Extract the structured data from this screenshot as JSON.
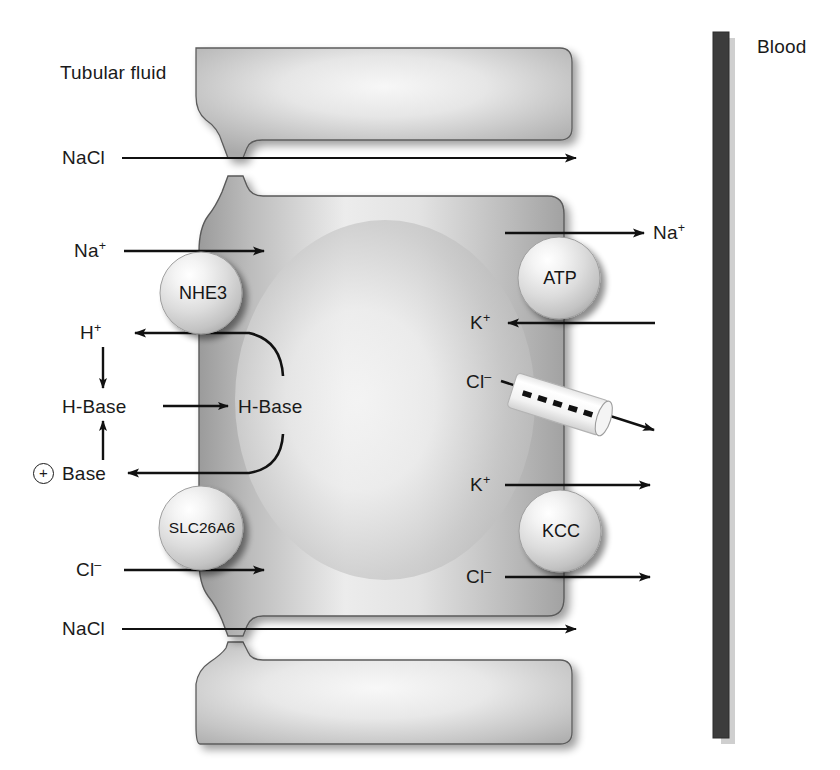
{
  "figure": {
    "type": "biological-cell-transport-diagram",
    "compartments": {
      "tubular_fluid_label": "Tubular fluid",
      "blood_label": "Blood"
    }
  },
  "labels": {
    "tubular_fluid": "Tubular fluid",
    "blood": "Blood",
    "nacl_top": "NaCl",
    "nacl_bottom": "NaCl",
    "na_apical": "Na",
    "na_apical_charge": "+",
    "h_apical": "H",
    "h_apical_charge": "+",
    "hbase_out": "H-Base",
    "hbase_in": "H-Base",
    "base_out": "Base",
    "base_plus_sign": "+",
    "cl_apical": "Cl",
    "cl_apical_charge": "–",
    "na_basolateral": "Na",
    "na_basolateral_charge": "+",
    "k_basolateral_in": "K",
    "k_basolateral_in_charge": "+",
    "cl_basolateral_channel": "Cl",
    "cl_basolateral_channel_charge": "–",
    "k_basolateral_kcc": "K",
    "k_basolateral_kcc_charge": "+",
    "cl_basolateral_kcc": "Cl",
    "cl_basolateral_kcc_charge": "–"
  },
  "transporters": [
    {
      "id": "nhe3",
      "name": "NHE3",
      "side": "apical",
      "shape": "sphere"
    },
    {
      "id": "slc26a6",
      "name": "SLC26A6",
      "side": "apical",
      "shape": "sphere"
    },
    {
      "id": "atp",
      "name": "ATP",
      "side": "basolateral",
      "shape": "sphere"
    },
    {
      "id": "kcc",
      "name": "KCC",
      "side": "basolateral",
      "shape": "sphere"
    },
    {
      "id": "cl-channel",
      "name": "",
      "side": "basolateral",
      "shape": "dashed-cylinder"
    }
  ],
  "colors": {
    "cell_fill_light": "#f2f2f2",
    "cell_fill_mid": "#b9b9b9",
    "cell_fill_dark": "#9a9a9a",
    "outline": "#4a4a4a",
    "arrow": "#111111",
    "blood_bar": "#3c3c3c",
    "blood_bar_shadow": "#c9c9c9",
    "text": "#1a1a1a",
    "sphere_highlight": "#ffffff",
    "sphere_mid": "#d7d7d7",
    "sphere_edge": "#9e9e9e"
  }
}
